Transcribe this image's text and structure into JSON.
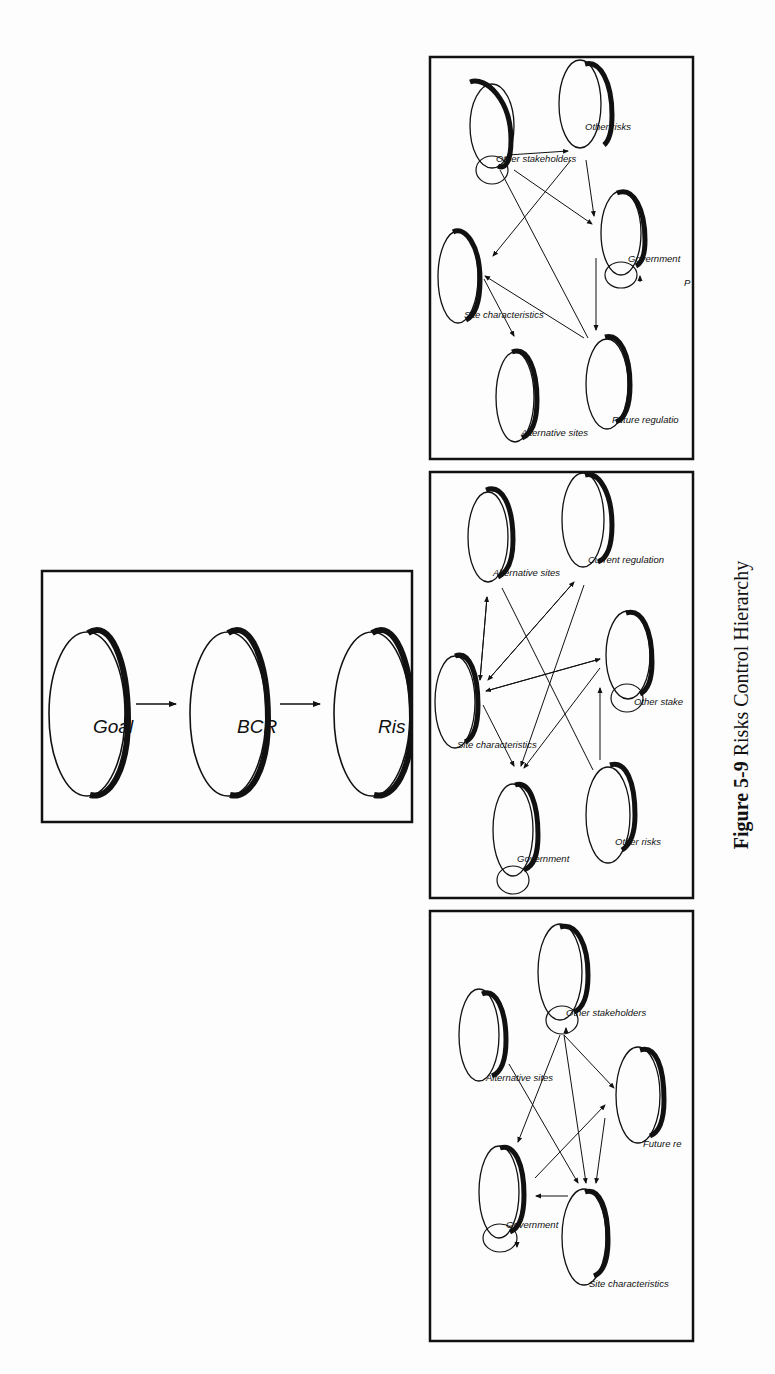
{
  "page": {
    "cut_off_header_line": "",
    "caption": {
      "number": "Figure 5-9",
      "title": "Risks Control Hierarchy"
    }
  },
  "main_hierarchy": {
    "nodes": [
      {
        "id": "goal",
        "label": "Goal"
      },
      {
        "id": "bcr",
        "label": "BCR"
      },
      {
        "id": "risk",
        "label": "Ris"
      }
    ],
    "arrows": [
      {
        "from": "goal",
        "to": "bcr"
      },
      {
        "from": "bcr",
        "to": "risk"
      }
    ]
  },
  "subnetworks": [
    {
      "name": "top",
      "nodes": [
        {
          "id": "other_stakeholders",
          "label": "Other stakeholders",
          "self_loop": true
        },
        {
          "id": "other_risks",
          "label": "Other risks"
        },
        {
          "id": "government",
          "label": "Government",
          "self_loop": true
        },
        {
          "id": "site_characteristics",
          "label": "Site characteristics"
        },
        {
          "id": "future_regulation",
          "label": "Future regulatio"
        },
        {
          "id": "alternative_sites",
          "label": "Alternative sites"
        }
      ],
      "extra_text": "P"
    },
    {
      "name": "middle",
      "nodes": [
        {
          "id": "alternative_sites",
          "label": "Alternative sites"
        },
        {
          "id": "current_regulation",
          "label": "Current regulation"
        },
        {
          "id": "other_stakeholders",
          "label": "Other stake",
          "self_loop": true
        },
        {
          "id": "site_characteristics",
          "label": "Site characteristics"
        },
        {
          "id": "government",
          "label": "Government",
          "self_loop": true
        },
        {
          "id": "other_risks",
          "label": "Other risks"
        }
      ]
    },
    {
      "name": "bottom",
      "nodes": [
        {
          "id": "other_stakeholders",
          "label": "Other stakeholders",
          "self_loop": true
        },
        {
          "id": "alternative_sites",
          "label": "Alternative sites"
        },
        {
          "id": "future_regulation",
          "label": "Future re"
        },
        {
          "id": "government",
          "label": "Government",
          "self_loop": true
        },
        {
          "id": "site_characteristics",
          "label": "Site characteristics"
        }
      ]
    }
  ],
  "colors": {
    "ink": "#111111",
    "paper": "#fdfdfd"
  }
}
